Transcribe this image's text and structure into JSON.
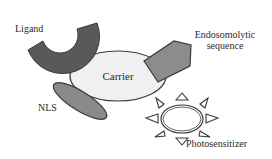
{
  "diagram": {
    "components": [
      {
        "id": "ligand",
        "label": "Ligand",
        "shape": "arc",
        "color": "#595959"
      },
      {
        "id": "carrier",
        "label": "Carrier",
        "shape": "ellipse",
        "color": "#f0f0f0"
      },
      {
        "id": "endosomolytic",
        "label_lines": [
          "Endosomolytic",
          "sequence"
        ],
        "shape": "pentagon",
        "color": "#8c8c8c"
      },
      {
        "id": "nls",
        "label": "NLS",
        "shape": "ellipse",
        "color": "#8a8a8a"
      },
      {
        "id": "photosensitizer",
        "label": "Photosensitizer",
        "shape": "sun",
        "color": "#ffffff"
      }
    ],
    "connections": [
      {
        "from": "carrier",
        "to": "ligand"
      },
      {
        "from": "carrier",
        "to": "endosomolytic"
      },
      {
        "from": "carrier",
        "to": "nls"
      },
      {
        "from": "carrier",
        "to": "photosensitizer"
      }
    ]
  },
  "labels": {
    "ligand": "Ligand",
    "carrier": "Carrier",
    "endosomolytic_1": "Endosomolytic",
    "endosomolytic_2": "sequence",
    "nls": "NLS",
    "photosensitizer": "Photosensitizer"
  },
  "colors": {
    "stroke": "#3a3a3a",
    "ligand_fill": "#595959",
    "carrier_fill": "#f0f0f0",
    "pentagon_fill": "#8c8c8c",
    "nls_fill": "#8a8a8a",
    "sun_fill": "#ffffff"
  }
}
